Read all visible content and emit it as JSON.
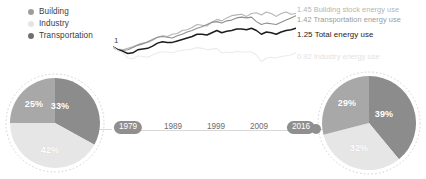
{
  "legend": {
    "items": [
      {
        "label": "Building",
        "color": "#9e9e9e",
        "icon": "legend-dot-building"
      },
      {
        "label": "Industry",
        "color": "#e4e4e4",
        "icon": "legend-dot-industry"
      },
      {
        "label": "Transportation",
        "color": "#707070",
        "icon": "legend-dot-transportation"
      }
    ]
  },
  "line_chart": {
    "baseline_label": "1",
    "end_labels": [
      {
        "value": "1.45",
        "text": "1.45 Building stock energy use"
      },
      {
        "value": "1.42",
        "text": "1.42 Transportation energy use"
      },
      {
        "value": "1.25",
        "text": "1.25 Total energy use"
      },
      {
        "value": "0.92",
        "text": "0.92 Industry energy use"
      }
    ]
  },
  "timeline": {
    "ticks": [
      "1989",
      "1999",
      "2009"
    ],
    "start_pill": "1979",
    "end_pill": "2016"
  },
  "pies": {
    "left": {
      "year": "1979",
      "slices": [
        {
          "name": "Building",
          "pct": "33%",
          "value": 33,
          "color": "#8c8c8c"
        },
        {
          "name": "Industry",
          "pct": "42%",
          "value": 42,
          "color": "#e6e6e6"
        },
        {
          "name": "Transportation",
          "pct": "25%",
          "value": 25,
          "color": "#a8a8a8"
        }
      ]
    },
    "right": {
      "year": "2016",
      "slices": [
        {
          "name": "Building",
          "pct": "39%",
          "value": 39,
          "color": "#8c8c8c"
        },
        {
          "name": "Industry",
          "pct": "32%",
          "value": 32,
          "color": "#e6e6e6"
        },
        {
          "name": "Transportation",
          "pct": "29%",
          "value": 29,
          "color": "#a8a8a8"
        }
      ]
    }
  },
  "chart_data": {
    "type": "line",
    "title": "",
    "xlabel": "",
    "ylabel": "Index (1979 = 1)",
    "x": [
      1979,
      1980,
      1981,
      1982,
      1983,
      1984,
      1985,
      1986,
      1987,
      1988,
      1989,
      1990,
      1991,
      1992,
      1993,
      1994,
      1995,
      1996,
      1997,
      1998,
      1999,
      2000,
      2001,
      2002,
      2003,
      2004,
      2005,
      2006,
      2007,
      2008,
      2009,
      2010,
      2011,
      2012,
      2013,
      2014,
      2015,
      2016
    ],
    "xlim": [
      1979,
      2016
    ],
    "ylim": [
      0.85,
      1.55
    ],
    "grid": false,
    "legend_position": "right-inline",
    "series": [
      {
        "name": "Building stock energy use",
        "color": "#b4b4b4",
        "end_value": 1.45,
        "values": [
          1.0,
          0.97,
          0.96,
          0.98,
          1.0,
          1.03,
          1.05,
          1.06,
          1.09,
          1.13,
          1.15,
          1.14,
          1.17,
          1.18,
          1.22,
          1.23,
          1.26,
          1.3,
          1.29,
          1.28,
          1.33,
          1.37,
          1.35,
          1.39,
          1.42,
          1.43,
          1.44,
          1.41,
          1.45,
          1.46,
          1.43,
          1.47,
          1.45,
          1.41,
          1.45,
          1.47,
          1.44,
          1.45
        ]
      },
      {
        "name": "Transportation energy use",
        "color": "#8f8f8f",
        "end_value": 1.42,
        "values": [
          1.0,
          0.96,
          0.95,
          0.96,
          0.99,
          1.02,
          1.04,
          1.07,
          1.1,
          1.13,
          1.14,
          1.13,
          1.12,
          1.15,
          1.17,
          1.2,
          1.22,
          1.25,
          1.27,
          1.3,
          1.33,
          1.34,
          1.32,
          1.35,
          1.36,
          1.39,
          1.4,
          1.39,
          1.4,
          1.34,
          1.3,
          1.32,
          1.31,
          1.3,
          1.33,
          1.36,
          1.39,
          1.42
        ]
      },
      {
        "name": "Total energy use",
        "color": "#1d1d1d",
        "end_value": 1.25,
        "values": [
          1.0,
          0.96,
          0.94,
          0.91,
          0.92,
          0.96,
          0.97,
          0.98,
          1.01,
          1.05,
          1.07,
          1.06,
          1.06,
          1.08,
          1.1,
          1.12,
          1.14,
          1.17,
          1.17,
          1.16,
          1.19,
          1.22,
          1.19,
          1.21,
          1.22,
          1.24,
          1.24,
          1.23,
          1.25,
          1.22,
          1.17,
          1.2,
          1.19,
          1.17,
          1.2,
          1.22,
          1.23,
          1.25
        ]
      },
      {
        "name": "Industry energy use",
        "color": "#ebebeb",
        "end_value": 0.92,
        "values": [
          1.0,
          0.95,
          0.92,
          0.85,
          0.84,
          0.88,
          0.87,
          0.86,
          0.89,
          0.92,
          0.93,
          0.93,
          0.92,
          0.94,
          0.95,
          0.96,
          0.97,
          0.99,
          0.98,
          0.96,
          0.97,
          0.98,
          0.92,
          0.93,
          0.92,
          0.94,
          0.93,
          0.93,
          0.93,
          0.89,
          0.8,
          0.85,
          0.86,
          0.85,
          0.87,
          0.88,
          0.89,
          0.92
        ]
      }
    ]
  }
}
